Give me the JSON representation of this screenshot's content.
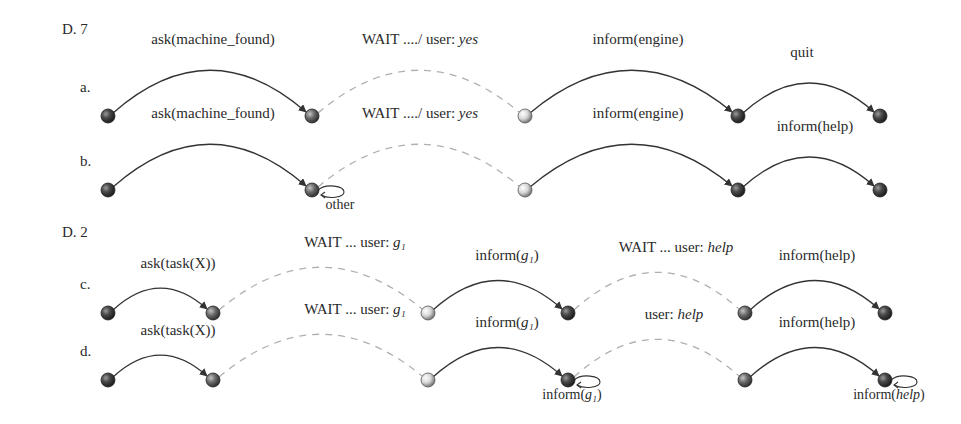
{
  "sections": [
    {
      "title": "D. 7",
      "rows": [
        {
          "label": "a.",
          "y": 116,
          "nodes": [
            {
              "x": 108,
              "fill": "dark"
            },
            {
              "x": 312,
              "fill": "mid"
            },
            {
              "x": 525,
              "fill": "light"
            },
            {
              "x": 738,
              "fill": "dark"
            },
            {
              "x": 880,
              "fill": "dark"
            }
          ],
          "edges": [
            {
              "from": 0,
              "to": 1,
              "style": "solid",
              "label": "ask(machine_found)",
              "label_x": 213
            },
            {
              "from": 1,
              "to": 2,
              "style": "dashed",
              "label_plain": "WAIT ..../ user: ",
              "label_math": "yes",
              "label_x": 420
            },
            {
              "from": 2,
              "to": 3,
              "style": "solid",
              "label": "inform(engine)",
              "label_x": 638
            },
            {
              "from": 3,
              "to": 4,
              "style": "solid",
              "label": "quit",
              "label_x": 802
            }
          ]
        },
        {
          "label": "b.",
          "y": 190,
          "nodes": [
            {
              "x": 108,
              "fill": "dark"
            },
            {
              "x": 312,
              "fill": "mid",
              "self_loop": true,
              "loop_label": "other"
            },
            {
              "x": 525,
              "fill": "light"
            },
            {
              "x": 738,
              "fill": "dark"
            },
            {
              "x": 880,
              "fill": "dark"
            }
          ],
          "edges": [
            {
              "from": 0,
              "to": 1,
              "style": "solid",
              "label": "ask(machine_found)",
              "label_x": 213
            },
            {
              "from": 1,
              "to": 2,
              "style": "dashed",
              "label_plain": "WAIT ..../ user: ",
              "label_math": "yes",
              "label_x": 420
            },
            {
              "from": 2,
              "to": 3,
              "style": "solid",
              "label": "inform(engine)",
              "label_x": 638
            },
            {
              "from": 3,
              "to": 4,
              "style": "solid",
              "label": "inform(help)",
              "label_x": 815
            }
          ]
        }
      ]
    },
    {
      "title": "D. 2",
      "rows": [
        {
          "label": "c.",
          "y": 313,
          "nodes": [
            {
              "x": 108,
              "fill": "dark"
            },
            {
              "x": 213,
              "fill": "mid"
            },
            {
              "x": 428,
              "fill": "light"
            },
            {
              "x": 568,
              "fill": "dark"
            },
            {
              "x": 745,
              "fill": "mid"
            },
            {
              "x": 885,
              "fill": "dark"
            }
          ],
          "edges": [
            {
              "from": 0,
              "to": 1,
              "style": "solid",
              "label": "ask(task(X))",
              "label_x": 178
            },
            {
              "from": 1,
              "to": 2,
              "style": "dashed",
              "label_plain": "WAIT ... user: ",
              "label_math": "g₁",
              "label_x": 355
            },
            {
              "from": 2,
              "to": 3,
              "style": "solid",
              "label_plain": "inform(",
              "label_math": "g₁",
              "label_tail": ")",
              "label_x": 507
            },
            {
              "from": 3,
              "to": 4,
              "style": "dashed",
              "label_plain": "WAIT ... user: ",
              "label_math": "help",
              "label_x": 676
            },
            {
              "from": 4,
              "to": 5,
              "style": "solid",
              "label": "inform(help)",
              "label_x": 817
            }
          ]
        },
        {
          "label": "d.",
          "y": 380,
          "nodes": [
            {
              "x": 108,
              "fill": "dark"
            },
            {
              "x": 213,
              "fill": "mid"
            },
            {
              "x": 428,
              "fill": "light"
            },
            {
              "x": 568,
              "fill": "dark",
              "self_loop": true,
              "loop_label_plain": "inform(",
              "loop_label_math": "g₁",
              "loop_label_tail": ")"
            },
            {
              "x": 745,
              "fill": "mid"
            },
            {
              "x": 885,
              "fill": "dark",
              "self_loop": true,
              "loop_label_plain": "inform(",
              "loop_label_math": "help",
              "loop_label_tail": ")"
            }
          ],
          "edges": [
            {
              "from": 0,
              "to": 1,
              "style": "solid",
              "label": "ask(task(X))",
              "label_x": 178
            },
            {
              "from": 1,
              "to": 2,
              "style": "dashed",
              "label_plain": "WAIT ... user: ",
              "label_math": "g₁",
              "label_x": 355
            },
            {
              "from": 2,
              "to": 3,
              "style": "solid",
              "label_plain": "inform(",
              "label_math": "g₁",
              "label_tail": ")",
              "label_x": 507
            },
            {
              "from": 3,
              "to": 4,
              "style": "dashed",
              "label_plain": "user: ",
              "label_math": "help",
              "label_x": 674
            },
            {
              "from": 4,
              "to": 5,
              "style": "solid",
              "label": "inform(help)",
              "label_x": 817
            }
          ]
        }
      ]
    }
  ],
  "colors": {
    "solid_edge": "#333333",
    "dashed_edge": "#b0b0b0",
    "node_dark": "#3a3a3a",
    "node_mid": "#5a5a5a",
    "node_light": "#d8d8d8",
    "text": "#2a2a2a"
  }
}
